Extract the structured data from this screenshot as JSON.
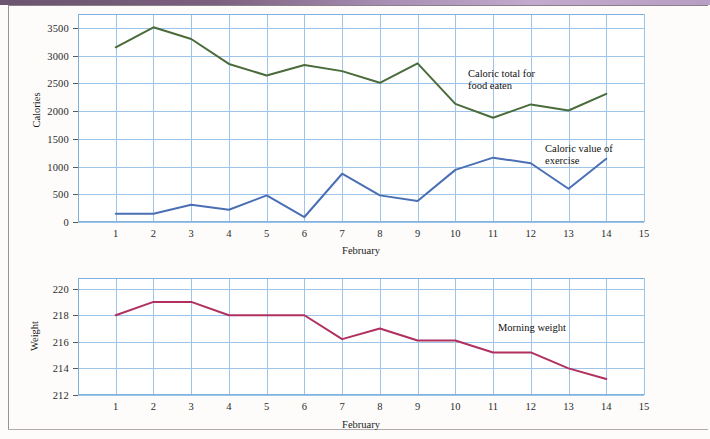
{
  "page": {
    "background_color": "#fdfcfa",
    "top_band_color": "#7a5f7e"
  },
  "charts": [
    {
      "id": "calories-chart",
      "ylabel": "Calories",
      "xlabel": "February",
      "series_labels": [
        {
          "name": "caloric-total-label",
          "text": "Caloric total for\nfood eaten",
          "color": "#4a6b3a"
        },
        {
          "name": "caloric-exercise-label",
          "text": "Caloric value of\nexercise",
          "color": "#4a6fb5"
        }
      ]
    },
    {
      "id": "weight-chart",
      "ylabel": "Weight",
      "xlabel": "February",
      "series_labels": [
        {
          "name": "morning-weight-label",
          "text": "Morning weight",
          "color": "#b03060"
        }
      ]
    }
  ],
  "chart_data": [
    {
      "type": "line",
      "title": "",
      "xlabel": "February",
      "ylabel": "Calories",
      "x": [
        1,
        2,
        3,
        4,
        5,
        6,
        7,
        8,
        9,
        10,
        11,
        12,
        13,
        14
      ],
      "xlim": [
        0,
        15
      ],
      "ylim": [
        0,
        3750
      ],
      "xticks": [
        1,
        2,
        3,
        4,
        5,
        6,
        7,
        8,
        9,
        10,
        11,
        12,
        13,
        14,
        15
      ],
      "yticks": [
        0,
        500,
        1000,
        1500,
        2000,
        2500,
        3000,
        3500
      ],
      "grid": true,
      "legend": "inline-annotation",
      "series": [
        {
          "name": "Caloric total for food eaten",
          "color": "#4a6b3a",
          "values": [
            3150,
            3510,
            3300,
            2850,
            2640,
            2830,
            2720,
            2510,
            2860,
            2130,
            1880,
            2120,
            2010,
            2310
          ]
        },
        {
          "name": "Caloric value of exercise",
          "color": "#4a6fb5",
          "values": [
            150,
            150,
            310,
            220,
            480,
            90,
            870,
            480,
            380,
            940,
            1160,
            1060,
            600,
            1140
          ]
        }
      ]
    },
    {
      "type": "line",
      "title": "",
      "xlabel": "February",
      "ylabel": "Weight",
      "x": [
        1,
        2,
        3,
        4,
        5,
        6,
        7,
        8,
        9,
        10,
        11,
        12,
        13,
        14
      ],
      "xlim": [
        0,
        15
      ],
      "ylim": [
        212,
        220.8
      ],
      "xticks": [
        1,
        2,
        3,
        4,
        5,
        6,
        7,
        8,
        9,
        10,
        11,
        12,
        13,
        14,
        15
      ],
      "yticks": [
        212,
        214,
        216,
        218,
        220
      ],
      "grid": true,
      "legend": "inline-annotation",
      "series": [
        {
          "name": "Morning weight",
          "color": "#b03060",
          "values": [
            218.0,
            219.0,
            219.0,
            218.0,
            218.0,
            218.0,
            216.2,
            217.0,
            216.1,
            216.1,
            215.2,
            215.2,
            214.0,
            213.2
          ]
        }
      ]
    }
  ]
}
